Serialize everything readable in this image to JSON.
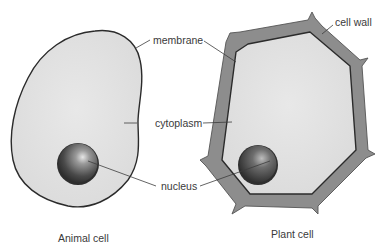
{
  "diagram": {
    "labels": {
      "membrane": "membrane",
      "cell_wall": "cell wall",
      "cytoplasm": "cytoplasm",
      "nucleus": "nucleus"
    },
    "captions": {
      "animal": "Animal cell",
      "plant": "Plant cell"
    },
    "colors": {
      "cytoplasm_fill": "#e3e3e3",
      "membrane_stroke": "#2b2b2b",
      "cell_wall_fill": "#8a8a8a",
      "nucleus_fill": "#4a4a4a",
      "nucleus_highlight": "#d8d8d8",
      "leader_line": "#3c3c3c",
      "text": "#3a3a3a"
    }
  }
}
